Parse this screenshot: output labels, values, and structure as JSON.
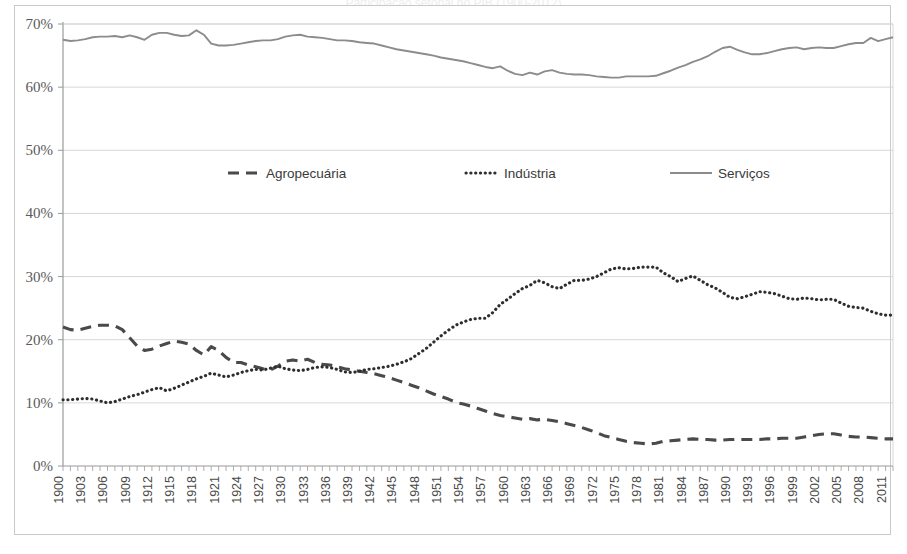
{
  "figure": {
    "title_partial": "",
    "y_axis": {
      "tick_labels": [
        "0%",
        "10%",
        "20%",
        "30%",
        "40%",
        "50%",
        "60%",
        "70%"
      ],
      "min": 0,
      "max": 70,
      "step": 10
    },
    "x_axis": {
      "tick_labels": [
        "1900",
        "1903",
        "1906",
        "1909",
        "1912",
        "1915",
        "1918",
        "1921",
        "1924",
        "1927",
        "1930",
        "1933",
        "1936",
        "1939",
        "1942",
        "1945",
        "1948",
        "1951",
        "1954",
        "1957",
        "1960",
        "1963",
        "1966",
        "1969",
        "1972",
        "1975",
        "1978",
        "1981",
        "1984",
        "1987",
        "1990",
        "1993",
        "1996",
        "1999",
        "2002",
        "2005",
        "2008",
        "2011"
      ],
      "min": 1900,
      "max": 2012
    },
    "legend": {
      "items": [
        {
          "label": "Agropecuária",
          "style": "dashed",
          "color": "#4a4a4a"
        },
        {
          "label": "Indústria",
          "style": "dotted",
          "color": "#2e2e2e"
        },
        {
          "label": "Serviços",
          "style": "solid",
          "color": "#8c8c8c"
        }
      ]
    },
    "colors": {
      "agropecuaria": "#4a4a4a",
      "industria": "#2e2e2e",
      "servicos": "#8c8c8c",
      "grid": "#d3d3d3",
      "axis": "#9a9a9a",
      "frame": "#c9c9c9",
      "background": "#ffffff"
    }
  },
  "chart_data": {
    "type": "line",
    "title": "Participação setorial no PIB (1900-2012)",
    "subtitle": "",
    "xlabel": "",
    "ylabel": "",
    "xlim": [
      1900,
      2012
    ],
    "ylim": [
      0,
      70
    ],
    "y_tick_step": 10,
    "y_tick_format": "percent",
    "grid": "horizontal",
    "legend_position": "inside-upper-center",
    "x": [
      1900,
      1901,
      1902,
      1903,
      1904,
      1905,
      1906,
      1907,
      1908,
      1909,
      1910,
      1911,
      1912,
      1913,
      1914,
      1915,
      1916,
      1917,
      1918,
      1919,
      1920,
      1921,
      1922,
      1923,
      1924,
      1925,
      1926,
      1927,
      1928,
      1929,
      1930,
      1931,
      1932,
      1933,
      1934,
      1935,
      1936,
      1937,
      1938,
      1939,
      1940,
      1941,
      1942,
      1943,
      1944,
      1945,
      1946,
      1947,
      1948,
      1949,
      1950,
      1951,
      1952,
      1953,
      1954,
      1955,
      1956,
      1957,
      1958,
      1959,
      1960,
      1961,
      1962,
      1963,
      1964,
      1965,
      1966,
      1967,
      1968,
      1969,
      1970,
      1971,
      1972,
      1973,
      1974,
      1975,
      1976,
      1977,
      1978,
      1979,
      1980,
      1981,
      1982,
      1983,
      1984,
      1985,
      1986,
      1987,
      1988,
      1989,
      1990,
      1991,
      1992,
      1993,
      1994,
      1995,
      1996,
      1997,
      1998,
      1999,
      2000,
      2001,
      2002,
      2003,
      2004,
      2005,
      2006,
      2007,
      2008,
      2009,
      2010,
      2011,
      2012
    ],
    "series": [
      {
        "name": "Agropecuária",
        "style": "dashed",
        "color": "#4a4a4a",
        "values": [
          22.0,
          21.6,
          21.5,
          21.8,
          22.1,
          22.3,
          22.3,
          22.2,
          21.6,
          20.3,
          19.0,
          18.3,
          18.5,
          19.0,
          19.4,
          19.8,
          19.6,
          19.3,
          18.3,
          17.6,
          18.9,
          18.3,
          17.2,
          16.4,
          16.4,
          16.0,
          15.7,
          15.4,
          15.2,
          15.8,
          16.6,
          16.8,
          16.6,
          16.9,
          16.4,
          16.1,
          16.0,
          15.7,
          15.4,
          15.2,
          15.0,
          14.8,
          14.6,
          14.3,
          14.0,
          13.6,
          13.2,
          12.8,
          12.4,
          11.9,
          11.4,
          11.0,
          10.6,
          10.1,
          9.8,
          9.5,
          9.1,
          8.7,
          8.3,
          8.0,
          7.8,
          7.6,
          7.4,
          7.5,
          7.3,
          7.4,
          7.2,
          7.0,
          6.7,
          6.4,
          6.1,
          5.7,
          5.3,
          4.8,
          4.5,
          4.2,
          3.9,
          3.7,
          3.6,
          3.5,
          3.6,
          3.9,
          4.0,
          4.1,
          4.2,
          4.3,
          4.2,
          4.2,
          4.1,
          4.1,
          4.2,
          4.2,
          4.2,
          4.2,
          4.2,
          4.3,
          4.3,
          4.4,
          4.4,
          4.4,
          4.6,
          4.8,
          5.0,
          5.1,
          5.1,
          4.9,
          4.7,
          4.6,
          4.6,
          4.5,
          4.4,
          4.3,
          4.3
        ]
      },
      {
        "name": "Indústria",
        "style": "dotted",
        "color": "#2e2e2e",
        "values": [
          10.5,
          10.5,
          10.6,
          10.7,
          10.6,
          10.3,
          10.0,
          10.2,
          10.6,
          11.0,
          11.3,
          11.7,
          12.1,
          12.4,
          11.9,
          12.3,
          12.8,
          13.3,
          13.8,
          14.2,
          14.7,
          14.4,
          14.1,
          14.4,
          14.8,
          15.1,
          15.3,
          15.2,
          15.5,
          15.8,
          15.4,
          15.2,
          15.1,
          15.3,
          15.6,
          15.7,
          15.6,
          15.3,
          14.9,
          14.8,
          15.0,
          15.3,
          15.4,
          15.6,
          15.8,
          16.1,
          16.5,
          17.0,
          17.8,
          18.6,
          19.6,
          20.6,
          21.5,
          22.3,
          22.8,
          23.2,
          23.4,
          23.4,
          24.3,
          25.6,
          26.4,
          27.3,
          28.1,
          28.6,
          29.4,
          29.0,
          28.4,
          28.1,
          28.8,
          29.4,
          29.4,
          29.6,
          30.0,
          30.6,
          31.2,
          31.4,
          31.2,
          31.3,
          31.5,
          31.5,
          31.5,
          30.6,
          30.0,
          29.2,
          29.7,
          30.1,
          29.4,
          28.7,
          28.2,
          27.5,
          26.7,
          26.5,
          26.8,
          27.2,
          27.6,
          27.5,
          27.3,
          26.9,
          26.5,
          26.4,
          26.6,
          26.5,
          26.3,
          26.4,
          26.4,
          25.8,
          25.3,
          25.1,
          25.0,
          24.5,
          24.1,
          23.9,
          23.9
        ]
      },
      {
        "name": "Serviços",
        "style": "solid",
        "color": "#8c8c8c",
        "values": [
          67.5,
          67.3,
          67.4,
          67.6,
          67.9,
          68.0,
          68.0,
          68.1,
          67.9,
          68.2,
          67.9,
          67.5,
          68.3,
          68.6,
          68.6,
          68.3,
          68.1,
          68.2,
          69.0,
          68.3,
          66.9,
          66.6,
          66.6,
          66.7,
          66.9,
          67.1,
          67.3,
          67.4,
          67.4,
          67.6,
          68.0,
          68.2,
          68.3,
          68.0,
          67.9,
          67.8,
          67.6,
          67.4,
          67.4,
          67.3,
          67.1,
          67.0,
          66.9,
          66.6,
          66.3,
          66.0,
          65.8,
          65.6,
          65.4,
          65.2,
          65.0,
          64.7,
          64.5,
          64.3,
          64.1,
          63.8,
          63.5,
          63.2,
          63.0,
          63.3,
          62.6,
          62.1,
          61.9,
          62.3,
          62.0,
          62.5,
          62.7,
          62.3,
          62.1,
          62.0,
          62.0,
          61.9,
          61.7,
          61.6,
          61.5,
          61.5,
          61.7,
          61.7,
          61.7,
          61.7,
          61.8,
          62.2,
          62.6,
          63.1,
          63.5,
          64.0,
          64.4,
          64.9,
          65.6,
          66.2,
          66.4,
          65.9,
          65.5,
          65.2,
          65.2,
          65.4,
          65.7,
          66.0,
          66.2,
          66.3,
          66.0,
          66.2,
          66.3,
          66.2,
          66.2,
          66.5,
          66.8,
          67.0,
          67.0,
          67.8,
          67.3,
          67.6,
          67.9
        ]
      }
    ]
  }
}
